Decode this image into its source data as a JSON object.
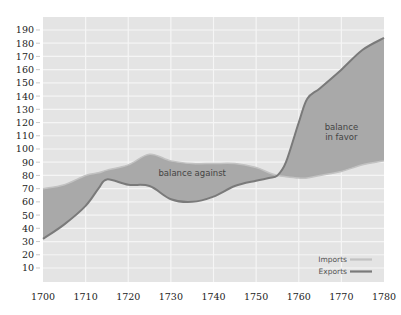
{
  "chart_data": {
    "type": "area",
    "title": "",
    "xlabel": "",
    "ylabel": "",
    "x": [
      1700,
      1705,
      1710,
      1713,
      1715,
      1720,
      1725,
      1730,
      1735,
      1740,
      1745,
      1750,
      1753,
      1755,
      1757,
      1760,
      1762,
      1765,
      1770,
      1775,
      1780
    ],
    "series": [
      {
        "name": "Imports",
        "color": "#b8b8b8",
        "values": [
          70,
          73,
          80,
          82,
          84,
          88,
          96,
          91,
          89,
          89,
          89,
          86,
          82,
          80,
          79,
          78,
          78,
          80,
          83,
          88,
          91
        ]
      },
      {
        "name": "Exports",
        "color": "#8a8a8a",
        "values": [
          32,
          43,
          57,
          70,
          77,
          73,
          72,
          62,
          60,
          64,
          72,
          76,
          78,
          80,
          90,
          120,
          138,
          146,
          160,
          175,
          184
        ]
      }
    ],
    "xlim": [
      1700,
      1780
    ],
    "ylim": [
      0,
      197
    ],
    "xticks": [
      "1700",
      "1710",
      "1720",
      "1730",
      "1740",
      "1750",
      "1760",
      "1770",
      "1780"
    ],
    "yticks": [
      "10",
      "20",
      "30",
      "40",
      "50",
      "60",
      "70",
      "80",
      "90",
      "100",
      "110",
      "120",
      "130",
      "140",
      "150",
      "160",
      "170",
      "180",
      "190"
    ],
    "annotations": [
      {
        "text": "balance against",
        "x": 1735,
        "y": 82
      },
      {
        "text": "balance",
        "x": 1770,
        "y": 117
      },
      {
        "text": "in favor",
        "x": 1770,
        "y": 109
      }
    ],
    "legend": {
      "position": "lower right",
      "entries": [
        "Imports",
        "Exports"
      ]
    },
    "grid": true,
    "colors": {
      "background": "#e4e4e4",
      "grid": "#f5f5f5",
      "fill": "#a9a9a9",
      "exports_line": "#7a7a7a",
      "imports_line": "#c2c2c2"
    }
  }
}
